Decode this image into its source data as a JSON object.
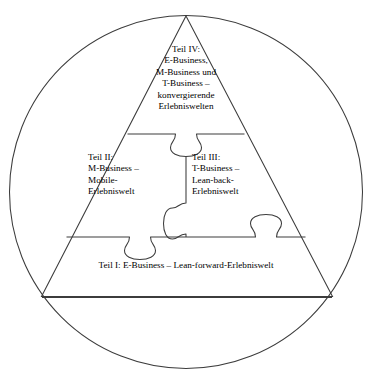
{
  "diagram": {
    "type": "jigsaw-pyramid",
    "shape_outer": "circle",
    "shape_inner": "triangle",
    "stroke_color": "#3c3c3c",
    "fill_color": "#ffffff",
    "text_color": "#000000",
    "pieces": [
      {
        "id": "teil-4",
        "position": "apex",
        "label": "Teil IV:\nE-Business,\nM-Business und\nT-Business –\nkonvergierende\nErlebniswelten",
        "lines": [
          "Teil IV:",
          "E-Business,",
          "M-Business und",
          "T-Business –",
          "konvergierende",
          "Erlebniswelten"
        ]
      },
      {
        "id": "teil-2",
        "position": "middle-left",
        "label": "Teil II:\nM-Business –\nMobile-\nErlebniswelt",
        "lines": [
          "Teil II:",
          "M-Business –",
          "Mobile-",
          "Erlebniswelt"
        ]
      },
      {
        "id": "teil-3",
        "position": "middle-right",
        "label": "Teil III:\nT-Business –\nLean-back-\nErlebniswelt",
        "lines": [
          "Teil III:",
          "T-Business –",
          "Lean-back-",
          "Erlebniswelt"
        ]
      },
      {
        "id": "teil-1",
        "position": "base",
        "label": "Teil I:  E-Business – Lean-forward-Erlebniswelt",
        "lines": [
          "Teil I:  E-Business – Lean-forward-Erlebniswelt"
        ]
      }
    ],
    "connectors": [
      {
        "id": "tab-apex-center",
        "orientation": "down",
        "between": "teil-4 / teil-2+teil-3"
      },
      {
        "id": "tab-vertical-mid",
        "orientation": "left",
        "between": "teil-3 / teil-2"
      },
      {
        "id": "tab-base-left",
        "orientation": "down",
        "between": "teil-2 / teil-1"
      },
      {
        "id": "tab-base-right",
        "orientation": "up",
        "between": "teil-1 / teil-3"
      }
    ]
  }
}
